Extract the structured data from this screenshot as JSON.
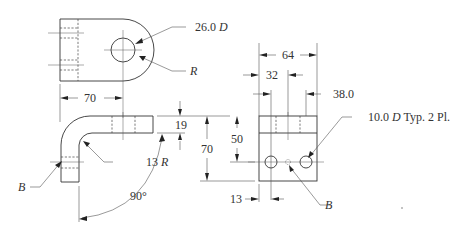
{
  "drawing": {
    "type": "orthographic technical drawing of bent bracket",
    "top_view": {
      "hole_callout": "26.0",
      "hole_callout_suffix": "D",
      "radius_callout": "R",
      "width_dim": "70"
    },
    "front_view": {
      "bend_radius": "13",
      "bend_radius_suffix": "R",
      "thickness_dim": "19",
      "angle_dim": "90°",
      "hole_ref": "B"
    },
    "side_view": {
      "width_overall": "64",
      "hole_spacing": "32",
      "hole_edge_offset": "38.0",
      "height_overall": "70",
      "hole_height": "50",
      "edge_offset": "13",
      "hole_callout_value": "10.0",
      "hole_callout_suffix": "D",
      "hole_callout_note": "Typ. 2 Pl.",
      "hole_ref": "B"
    }
  }
}
